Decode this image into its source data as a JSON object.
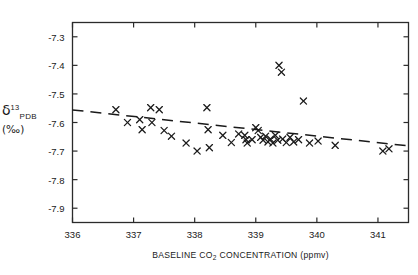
{
  "chart_data": {
    "type": "scatter",
    "title": "",
    "xlabel": "BASELINE  CO2  CONCENTRATION  (ppmv)",
    "xlabel_parts": {
      "prefix": "BASELINE  CO",
      "subscript": "2",
      "suffix": "  CONCENTRATION  (ppmv)"
    },
    "ylabel_parts": {
      "symbol": "δ",
      "superscript": "13",
      "subscript": "PDB",
      "units": "(‰)"
    },
    "ylabel": "δ13 PDB (‰)",
    "xlim": [
      336.0,
      341.5
    ],
    "ylim": [
      -7.95,
      -7.25
    ],
    "xticks": [
      336,
      337,
      338,
      339,
      340,
      341
    ],
    "xtick_labels": [
      "336",
      "337",
      "338",
      "339",
      "340",
      "341"
    ],
    "yticks": [
      -7.3,
      -7.4,
      -7.5,
      -7.6,
      -7.7,
      -7.8,
      -7.9
    ],
    "ytick_labels": [
      "-7.3",
      "-7.4",
      "-7.5",
      "-7.6",
      "-7.7",
      "-7.8",
      "-7.9"
    ],
    "grid": false,
    "legend": null,
    "marker": "x",
    "marker_color": "#1a1a1a",
    "axis_color": "#2b2b2b",
    "points": [
      {
        "x": 336.71,
        "y": -7.555
      },
      {
        "x": 336.9,
        "y": -7.6
      },
      {
        "x": 337.1,
        "y": -7.59
      },
      {
        "x": 337.14,
        "y": -7.625
      },
      {
        "x": 337.28,
        "y": -7.548
      },
      {
        "x": 337.3,
        "y": -7.6
      },
      {
        "x": 337.42,
        "y": -7.555
      },
      {
        "x": 337.5,
        "y": -7.628
      },
      {
        "x": 337.62,
        "y": -7.648
      },
      {
        "x": 337.86,
        "y": -7.672
      },
      {
        "x": 338.04,
        "y": -7.7
      },
      {
        "x": 338.2,
        "y": -7.548
      },
      {
        "x": 338.22,
        "y": -7.625
      },
      {
        "x": 338.24,
        "y": -7.688
      },
      {
        "x": 338.46,
        "y": -7.645
      },
      {
        "x": 338.6,
        "y": -7.67
      },
      {
        "x": 338.72,
        "y": -7.64
      },
      {
        "x": 338.82,
        "y": -7.645
      },
      {
        "x": 338.84,
        "y": -7.66
      },
      {
        "x": 338.86,
        "y": -7.672
      },
      {
        "x": 338.94,
        "y": -7.66
      },
      {
        "x": 339.0,
        "y": -7.618
      },
      {
        "x": 339.04,
        "y": -7.628
      },
      {
        "x": 339.08,
        "y": -7.652
      },
      {
        "x": 339.12,
        "y": -7.662
      },
      {
        "x": 339.16,
        "y": -7.648
      },
      {
        "x": 339.2,
        "y": -7.668
      },
      {
        "x": 339.24,
        "y": -7.658
      },
      {
        "x": 339.28,
        "y": -7.672
      },
      {
        "x": 339.32,
        "y": -7.645
      },
      {
        "x": 339.36,
        "y": -7.662
      },
      {
        "x": 339.38,
        "y": -7.4
      },
      {
        "x": 339.42,
        "y": -7.424
      },
      {
        "x": 339.44,
        "y": -7.658
      },
      {
        "x": 339.5,
        "y": -7.67
      },
      {
        "x": 339.56,
        "y": -7.652
      },
      {
        "x": 339.62,
        "y": -7.668
      },
      {
        "x": 339.7,
        "y": -7.66
      },
      {
        "x": 339.78,
        "y": -7.525
      },
      {
        "x": 339.88,
        "y": -7.672
      },
      {
        "x": 340.02,
        "y": -7.665
      },
      {
        "x": 340.3,
        "y": -7.68
      },
      {
        "x": 341.08,
        "y": -7.7
      },
      {
        "x": 341.18,
        "y": -7.692
      }
    ],
    "trendline": {
      "style": "dashed",
      "x_start": 336.0,
      "y_start": -7.556,
      "x_end": 341.5,
      "y_end": -7.682
    }
  }
}
